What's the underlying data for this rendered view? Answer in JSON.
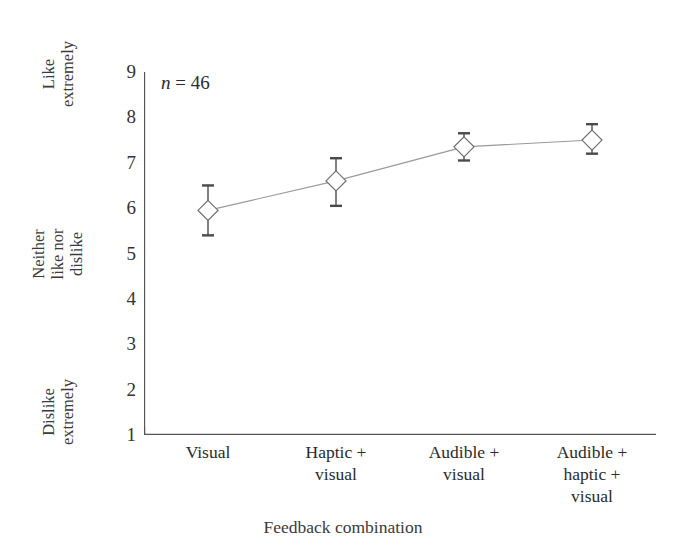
{
  "chart_data": {
    "type": "line",
    "title": "",
    "subtitle": "",
    "xlabel": "Feedback combination",
    "ylabel": "",
    "categories": [
      "Visual",
      "Haptic + visual",
      "Audible + visual",
      "Audible + haptic + visual"
    ],
    "category_lines": [
      [
        "Visual"
      ],
      [
        "Haptic +",
        "visual"
      ],
      [
        "Audible +",
        "visual"
      ],
      [
        "Audible +",
        "haptic +",
        "visual"
      ]
    ],
    "series": [
      {
        "name": "Mean liking rating",
        "values": [
          5.95,
          6.6,
          7.35,
          7.5
        ],
        "error_lower": [
          5.4,
          6.05,
          7.05,
          7.2
        ],
        "error_upper": [
          6.5,
          7.1,
          7.65,
          7.85
        ],
        "marker": "diamond-open",
        "line_color": "#9a9a9a",
        "marker_color": "#6e6e6e",
        "error_color": "#4a4a4a"
      }
    ],
    "ylim": [
      1,
      9
    ],
    "yticks": [
      1,
      2,
      3,
      4,
      5,
      6,
      7,
      8,
      9
    ],
    "ytick_labels": [
      "1",
      "2",
      "3",
      "4",
      "5",
      "6",
      "7",
      "8",
      "9"
    ],
    "grid": false,
    "legend": "none",
    "annotations": [
      {
        "name": "sample-size",
        "italic_part": "n",
        "rest": " = 46",
        "text": "n = 46"
      }
    ],
    "y_anchor_labels": [
      {
        "name": "like-extremely",
        "value": 9,
        "lines": [
          "Like",
          "extremely"
        ]
      },
      {
        "name": "neither-like-nor-dislike",
        "value": 5,
        "lines": [
          "Neither",
          "like nor",
          "dislike"
        ]
      },
      {
        "name": "dislike-extremely",
        "value": 1,
        "lines": [
          "Dislike",
          "extremely"
        ]
      }
    ]
  }
}
